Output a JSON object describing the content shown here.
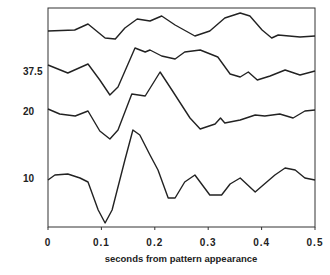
{
  "chart_data": {
    "type": "line",
    "title": "",
    "xlabel": "seconds from pattern appearance",
    "ylabel": "",
    "xlim": [
      0,
      0.5
    ],
    "xticks": [
      "0",
      "0.1",
      "0.2",
      "0.3",
      "0.4",
      "0.5"
    ],
    "xtick_values": [
      0,
      0.1,
      0.2,
      0.3,
      0.4,
      0.5
    ],
    "grid": false,
    "amplitude_units": "relative (arbitrary, upward positive)",
    "series": [
      {
        "name": "top (unlabeled)",
        "label": "",
        "baseline": 0,
        "x": [
          0,
          0.05,
          0.075,
          0.107,
          0.126,
          0.144,
          0.167,
          0.191,
          0.213,
          0.238,
          0.275,
          0.303,
          0.331,
          0.36,
          0.378,
          0.401,
          0.419,
          0.431,
          0.472,
          0.5
        ],
        "y": [
          0,
          1,
          7,
          -7,
          -8,
          3,
          12,
          10,
          15,
          6,
          -5,
          0,
          13,
          18,
          15,
          1,
          -7,
          -4,
          -6,
          -5
        ]
      },
      {
        "name": "37.5",
        "label": "37.5",
        "baseline": 0,
        "x": [
          0,
          0.037,
          0.075,
          0.097,
          0.116,
          0.131,
          0.163,
          0.182,
          0.191,
          0.213,
          0.238,
          0.256,
          0.285,
          0.318,
          0.341,
          0.36,
          0.375,
          0.392,
          0.416,
          0.444,
          0.472,
          0.5
        ],
        "y": [
          0,
          -8,
          1,
          -15,
          -30,
          -22,
          17,
          13,
          15,
          9,
          6,
          13,
          15,
          8,
          -9,
          -12,
          -7,
          -15,
          -11,
          -5,
          -10,
          -6
        ]
      },
      {
        "name": "20",
        "label": "20",
        "baseline": 0,
        "x": [
          0,
          0.022,
          0.051,
          0.075,
          0.097,
          0.116,
          0.131,
          0.157,
          0.182,
          0.21,
          0.232,
          0.266,
          0.285,
          0.313,
          0.323,
          0.331,
          0.36,
          0.388,
          0.406,
          0.434,
          0.459,
          0.481,
          0.5
        ],
        "y": [
          0,
          -5,
          -7,
          -2,
          -22,
          -30,
          -21,
          15,
          13,
          37,
          19,
          -9,
          -20,
          -15,
          -9,
          -14,
          -11,
          -6,
          -7,
          -5,
          -9,
          -2,
          -1
        ]
      },
      {
        "name": "10",
        "label": "10",
        "baseline": 0,
        "x": [
          0,
          0.013,
          0.037,
          0.06,
          0.075,
          0.094,
          0.107,
          0.12,
          0.144,
          0.159,
          0.172,
          0.191,
          0.206,
          0.225,
          0.238,
          0.256,
          0.275,
          0.303,
          0.325,
          0.341,
          0.36,
          0.388,
          0.401,
          0.425,
          0.444,
          0.463,
          0.481,
          0.5
        ],
        "y": [
          0,
          5,
          6,
          2,
          -2,
          -30,
          -43,
          -30,
          20,
          50,
          45,
          25,
          10,
          -18,
          -18,
          -2,
          5,
          -15,
          -15,
          -4,
          2,
          -12,
          -6,
          5,
          12,
          10,
          2,
          0
        ]
      }
    ]
  }
}
